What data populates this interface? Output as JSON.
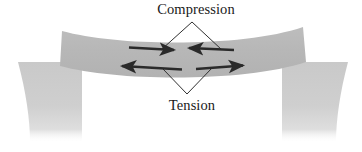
{
  "figure": {
    "name": "beam-bending-stress-diagram",
    "labels": {
      "compression": "Compression",
      "tension": "Tension"
    },
    "colors": {
      "beam_fill": "#b9b9b9",
      "support_fill": "#cfcfcf",
      "arrow_stroke": "#2a2a2a",
      "leader_stroke": "#303030",
      "text": "#1a1a1a",
      "background": "#ffffff"
    },
    "annotations": [
      {
        "id": "compression-annotation",
        "label": "Compression",
        "label_x": 196,
        "label_y": 14,
        "leader_shape": "caret-up",
        "leader_apex": [
          192,
          22
        ],
        "leader_left_end": [
          161,
          49
        ],
        "leader_right_end": [
          222,
          49
        ],
        "arrow_direction": "inward",
        "arrows": [
          {
            "name": "compression-arrow-left",
            "x1": 129,
            "y1": 47,
            "x2": 176,
            "y2": 50,
            "head": "end"
          },
          {
            "name": "compression-arrow-right",
            "x1": 232,
            "y1": 50,
            "x2": 186,
            "y2": 48,
            "head": "end"
          }
        ]
      },
      {
        "id": "tension-annotation",
        "label": "Tension",
        "label_x": 192,
        "label_y": 104,
        "leader_shape": "caret-down",
        "leader_apex": [
          187,
          94
        ],
        "leader_left_end": [
          163,
          68
        ],
        "leader_right_end": [
          214,
          68
        ],
        "arrow_direction": "outward",
        "arrows": [
          {
            "name": "tension-arrow-left",
            "x1": 180,
            "y1": 69,
            "x2": 120,
            "y2": 66,
            "head": "end"
          },
          {
            "name": "tension-arrow-right",
            "x1": 196,
            "y1": 69,
            "x2": 245,
            "y2": 65,
            "head": "end"
          }
        ]
      }
    ],
    "beam": {
      "name": "sagging-beam",
      "description": "horizontal beam curved downward in the middle spanning both supports",
      "left_end_x": 60,
      "right_end_x": 305,
      "top_y": 28,
      "bottom_y": 72
    },
    "supports": [
      {
        "name": "left-support",
        "x": 18,
        "y": 62,
        "width": 64,
        "height": 80,
        "concave_edge": "left"
      },
      {
        "name": "right-support",
        "x": 282,
        "y": 62,
        "width": 66,
        "height": 80,
        "concave_edge": "right"
      }
    ]
  }
}
